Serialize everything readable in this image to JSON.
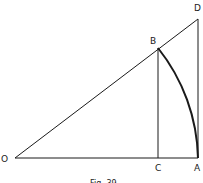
{
  "figure": {
    "caption": "Fig. 39",
    "points": {
      "O": {
        "label": "O",
        "x": 15,
        "y": 158
      },
      "C": {
        "label": "C",
        "x": 158,
        "y": 158
      },
      "A": {
        "label": "A",
        "x": 198,
        "y": 158
      },
      "B": {
        "label": "B",
        "x": 158,
        "y": 48
      },
      "D": {
        "label": "D",
        "x": 198,
        "y": 19
      }
    },
    "segments": [
      "OA",
      "OD",
      "BC",
      "DA"
    ],
    "arc": {
      "from": "B",
      "to": "A",
      "center": "O"
    },
    "colors": {
      "line": "#1a1a1a",
      "background": "#ffffff"
    }
  }
}
